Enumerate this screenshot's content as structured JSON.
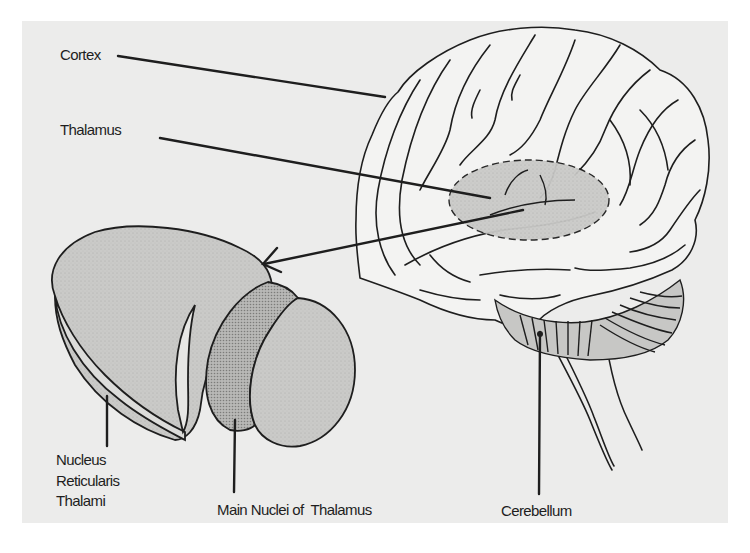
{
  "figure": {
    "type": "anatomical-diagram",
    "background_color": "#ececeb",
    "line_color": "#1e1e1e",
    "shade_light": "#c9c9c7",
    "shade_dark": "#a9a9a7"
  },
  "labels": {
    "cortex": "Cortex",
    "thalamus": "Thalamus",
    "nucleus_reticularis": [
      "Nucleus",
      "Reticularis",
      "Thalami"
    ],
    "main_nuclei": "Main Nuclei of  Thalamus",
    "cerebellum": "Cerebellum"
  },
  "structures": [
    {
      "name": "cortex",
      "pointer": "line from label to cortical surface"
    },
    {
      "name": "thalamus",
      "pointer": "line from label to dashed shaded thalamic region"
    },
    {
      "name": "enlargement-arrow",
      "pointer": "arrow from thalamus to enlarged 3D thalamus"
    },
    {
      "name": "nucleus-reticularis-thalami",
      "pointer": "vertical line to outer shell"
    },
    {
      "name": "main-nuclei-of-thalamus",
      "pointer": "vertical line to dotted inner nuclei"
    },
    {
      "name": "cerebellum",
      "pointer": "vertical line to striated cerebellum"
    }
  ]
}
